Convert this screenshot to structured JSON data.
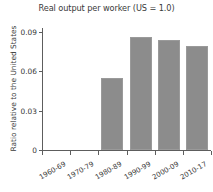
{
  "chart_data": {
    "type": "bar",
    "title": "Real output per worker (US = 1.0)",
    "xlabel": "",
    "ylabel": "Ratio relative to the United States",
    "categories": [
      "1960-69",
      "1970-79",
      "1980-89",
      "1990-99",
      "2000-09",
      "2010-17"
    ],
    "values": [
      0,
      0,
      0.055,
      0.086,
      0.084,
      0.079
    ],
    "ylim": [
      0,
      0.093
    ],
    "yticks": [
      0,
      0.03,
      0.06,
      0.09
    ],
    "ytick_labels": [
      "0",
      "0.03",
      "0.06",
      "0.09"
    ],
    "grid": false,
    "legend": "none",
    "bar_color": "#8c8c8c",
    "axis_color": "#5d5d5d",
    "background": "#ffffff"
  }
}
